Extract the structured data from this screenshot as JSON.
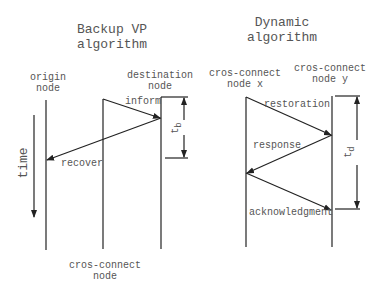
{
  "left": {
    "title_line1": "Backup VP",
    "title_line2": "algorithm",
    "origin_line1": "origin",
    "origin_line2": "node",
    "dest_line1": "destination",
    "dest_line2": "node",
    "cros_line1": "cros-connect",
    "cros_line2": "node",
    "msg_inform": "inform",
    "msg_recover": "recover",
    "interval": "t",
    "interval_sub": "b",
    "time_label": "time"
  },
  "right": {
    "title_line1": "Dynamic",
    "title_line2": "algorithm",
    "nodex_line1": "cros-connect",
    "nodex_line2": "node x",
    "nodey_line1": "cros-connect",
    "nodey_line2": "node y",
    "msg_restoration": "restoration",
    "msg_response": "response",
    "msg_ack": "acknowledgment",
    "interval": "t",
    "interval_sub": "d"
  }
}
